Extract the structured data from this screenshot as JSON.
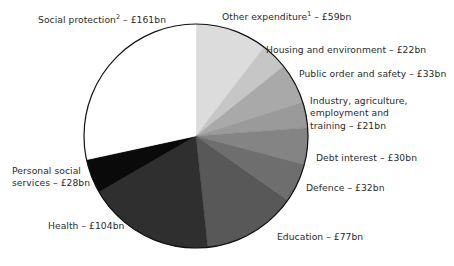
{
  "figure": {
    "background": "#ffffff",
    "text_color": "#2b2b2b",
    "outline_color": "#111111"
  },
  "chart_data": {
    "type": "pie",
    "title": "",
    "units": "£bn",
    "total": 567,
    "start_angle_deg": 0,
    "direction": "clockwise",
    "legend": "none",
    "labels_position": "outside-callout",
    "categories": [
      "Other expenditure¹",
      "Housing and environment",
      "Public order and safety",
      "Industry, agriculture, employment and training",
      "Debt interest",
      "Defence",
      "Education",
      "Health",
      "Personal social services",
      "Social protection²"
    ],
    "values": [
      59,
      22,
      33,
      21,
      30,
      32,
      77,
      104,
      28,
      161
    ],
    "colors": [
      "#dcdcdc",
      "#c6c6c6",
      "#a9a9a9",
      "#9a9a9a",
      "#848484",
      "#6e6e6e",
      "#585858",
      "#2f2f2f",
      "#0a0a0a",
      "#ffffff"
    ],
    "slices": [
      {
        "name": "Other expenditure",
        "footnote": "1",
        "value": 59,
        "display": "Other expenditure¹ – £59bn",
        "color": "#dcdcdc"
      },
      {
        "name": "Housing and environment",
        "footnote": "",
        "value": 22,
        "display": "Housing and environment – £22bn",
        "color": "#c6c6c6"
      },
      {
        "name": "Public order and safety",
        "footnote": "",
        "value": 33,
        "display": "Public order and safety – £33bn",
        "color": "#a9a9a9"
      },
      {
        "name": "Industry, agriculture, employment and training",
        "footnote": "",
        "value": 21,
        "display": "Industry, agriculture, employment and training – £21bn",
        "color": "#9a9a9a"
      },
      {
        "name": "Debt interest",
        "footnote": "",
        "value": 30,
        "display": "Debt interest – £30bn",
        "color": "#848484"
      },
      {
        "name": "Defence",
        "footnote": "",
        "value": 32,
        "display": "Defence – £32bn",
        "color": "#6e6e6e"
      },
      {
        "name": "Education",
        "footnote": "",
        "value": 77,
        "display": "Education – £77bn",
        "color": "#585858"
      },
      {
        "name": "Health",
        "footnote": "",
        "value": 104,
        "display": "Health – £104bn",
        "color": "#2f2f2f"
      },
      {
        "name": "Personal social services",
        "footnote": "",
        "value": 28,
        "display": "Personal social services – £28bn",
        "color": "#0a0a0a"
      },
      {
        "name": "Social protection",
        "footnote": "2",
        "value": 161,
        "display": "Social protection² – £161bn",
        "color": "#ffffff"
      }
    ]
  },
  "labels": {
    "social_protection": {
      "text_before": "Social protection",
      "sup": "2",
      "text_after": " – £161bn"
    },
    "other_expenditure": {
      "text_before": "Other expenditure",
      "sup": "1",
      "text_after": " – £59bn"
    },
    "housing_environment": "Housing and environment – £22bn",
    "public_order_safety": "Public order and safety – £33bn",
    "industry_line1": "Industry, agriculture,",
    "industry_line2": "employment and",
    "industry_line3": "training – £21bn",
    "debt_interest": "Debt interest – £30bn",
    "defence": "Defence – £32bn",
    "education": "Education – £77bn",
    "health": "Health – £104bn",
    "personal_social_line1": "Personal social",
    "personal_social_line2": "services – £28bn"
  }
}
